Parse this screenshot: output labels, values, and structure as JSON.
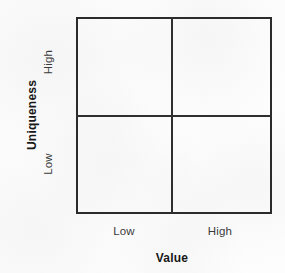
{
  "figure": {
    "type": "2x2-matrix",
    "background_color": "#fdfdfd",
    "line_color": "#2b2b2b"
  },
  "chart_data": {
    "type": "scatter",
    "title": "",
    "subtitle": "",
    "xlabel": "Value",
    "ylabel": "Uniqueness",
    "x_tick_labels": [
      "Low",
      "High"
    ],
    "y_tick_labels": [
      "Low",
      "High"
    ],
    "xlim": [
      0,
      2
    ],
    "ylim": [
      0,
      2
    ],
    "grid": true,
    "grid_description": "single vertical and single horizontal divider splitting the plot into four equal quadrants",
    "legend": null,
    "series": [],
    "values": [],
    "annotations": [],
    "quadrants": [
      {
        "id": "high-low",
        "value": "Low",
        "uniqueness": "High",
        "label": ""
      },
      {
        "id": "high-high",
        "value": "High",
        "uniqueness": "High",
        "label": ""
      },
      {
        "id": "low-low",
        "value": "Low",
        "uniqueness": "Low",
        "label": ""
      },
      {
        "id": "low-high",
        "value": "High",
        "uniqueness": "Low",
        "label": ""
      }
    ]
  },
  "axes": {
    "y": {
      "title": "Uniqueness",
      "ticks": {
        "high": "High",
        "low": "Low"
      }
    },
    "x": {
      "title": "Value",
      "ticks": {
        "low": "Low",
        "high": "High"
      }
    }
  }
}
